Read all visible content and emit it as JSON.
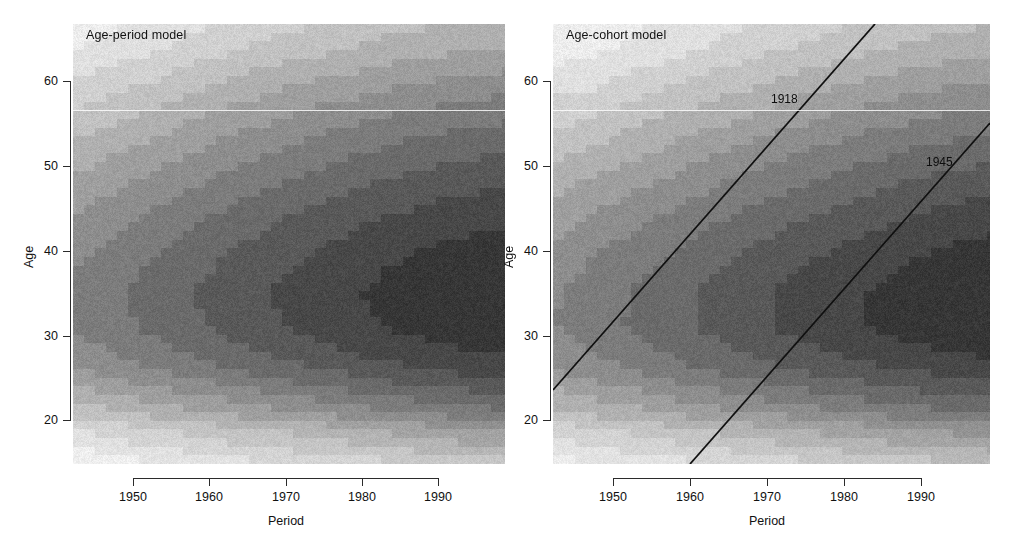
{
  "figure": {
    "width": 1013,
    "height": 550,
    "background": "#ffffff"
  },
  "panels": [
    {
      "id": "age-period",
      "title": "Age-period model",
      "x_axis": {
        "label": "Period",
        "ticks": [
          1950,
          1960,
          1970,
          1980,
          1990
        ],
        "range": [
          1943,
          1998
        ]
      },
      "y_axis": {
        "label": "Age",
        "ticks": [
          20,
          30,
          40,
          50,
          60
        ],
        "range": [
          14,
          65
        ]
      },
      "cohort_lines": []
    },
    {
      "id": "age-cohort",
      "title": "Age-cohort model",
      "x_axis": {
        "label": "Period",
        "ticks": [
          1950,
          1960,
          1970,
          1980,
          1990
        ],
        "range": [
          1943,
          1998
        ]
      },
      "y_axis": {
        "label": "Age",
        "ticks": [
          20,
          30,
          40,
          50,
          60
        ],
        "range": [
          14,
          65
        ]
      },
      "cohort_lines": [
        {
          "label": "1918",
          "cohort": 1918,
          "label_period": 1973.5,
          "label_age": 57.0
        },
        {
          "label": "1945",
          "cohort": 1945,
          "label_period": 1993.5,
          "label_age": 50.0
        }
      ]
    }
  ],
  "chart_data": {
    "type": "heatmap",
    "xlabel": "Period",
    "ylabel": "Age",
    "xlim": [
      1943,
      1998
    ],
    "ylim": [
      14,
      65
    ],
    "grid": false,
    "legend": "none",
    "colormap": "grayscale",
    "level_colors": [
      "#f2f2f2",
      "#e4e4e4",
      "#d4d4d4",
      "#c4c4c4",
      "#b2b2b2",
      "#a0a0a0",
      "#8e8e8e",
      "#7c7c7c",
      "#6a6a6a",
      "#585858",
      "#464646",
      "#343434"
    ],
    "n_levels": 12,
    "note": "Darker shading indicates higher modelled rate. Rate surface peaks near period 1988-1998, age 28-36.",
    "peak": {
      "period": 1992,
      "age": 32
    },
    "panels": [
      {
        "id": "age-period",
        "model": "Age-period model",
        "description": "Contour surface that is a product of a smooth age effect (peaking near age 32) and a monotonically increasing period effect; contour bands run diagonally up to the right in the upper half and horizontally across the lower band.",
        "x": [
          1943,
          1948,
          1953,
          1958,
          1963,
          1968,
          1973,
          1978,
          1983,
          1988,
          1993,
          1998
        ],
        "y": [
          14,
          18,
          22,
          26,
          30,
          34,
          38,
          42,
          46,
          50,
          54,
          58,
          62,
          65
        ],
        "values": [
          [
            0.5,
            0.6,
            0.7,
            0.8,
            0.9,
            1.0,
            1.1,
            1.2,
            1.3,
            1.5,
            1.6,
            1.7
          ],
          [
            1.0,
            1.2,
            1.4,
            1.6,
            1.8,
            2.0,
            2.2,
            2.5,
            2.8,
            3.1,
            3.4,
            3.6
          ],
          [
            2.2,
            2.6,
            3.0,
            3.4,
            3.9,
            4.4,
            5.0,
            5.6,
            6.2,
            6.8,
            7.4,
            7.9
          ],
          [
            3.8,
            4.4,
            5.1,
            5.9,
            6.8,
            7.7,
            8.6,
            9.6,
            10.6,
            11.5,
            12.3,
            12.9
          ],
          [
            4.8,
            5.6,
            6.5,
            7.6,
            8.8,
            10.0,
            11.2,
            12.5,
            13.8,
            15.0,
            16.0,
            16.8
          ],
          [
            4.9,
            5.8,
            6.8,
            7.9,
            9.1,
            10.4,
            11.7,
            13.1,
            14.4,
            15.6,
            16.7,
            17.5
          ],
          [
            4.4,
            5.2,
            6.1,
            7.1,
            8.2,
            9.3,
            10.5,
            11.8,
            13.0,
            14.1,
            15.1,
            15.8
          ],
          [
            3.7,
            4.3,
            5.0,
            5.9,
            6.8,
            7.8,
            8.8,
            9.8,
            10.8,
            11.7,
            12.5,
            13.1
          ],
          [
            2.9,
            3.4,
            4.0,
            4.6,
            5.4,
            6.1,
            6.9,
            7.7,
            8.5,
            9.2,
            9.9,
            10.4
          ],
          [
            2.2,
            2.6,
            3.0,
            3.5,
            4.1,
            4.7,
            5.3,
            5.9,
            6.5,
            7.1,
            7.6,
            8.0
          ],
          [
            1.6,
            1.9,
            2.2,
            2.6,
            3.0,
            3.4,
            3.9,
            4.3,
            4.8,
            5.2,
            5.6,
            5.9
          ],
          [
            1.1,
            1.3,
            1.5,
            1.8,
            2.1,
            2.4,
            2.7,
            3.0,
            3.3,
            3.6,
            3.9,
            4.1
          ],
          [
            0.7,
            0.9,
            1.0,
            1.2,
            1.4,
            1.6,
            1.8,
            2.0,
            2.2,
            2.4,
            2.6,
            2.7
          ],
          [
            0.6,
            0.7,
            0.8,
            1.0,
            1.1,
            1.3,
            1.4,
            1.6,
            1.8,
            1.9,
            2.1,
            2.2
          ]
        ]
      },
      {
        "id": "age-cohort",
        "model": "Age-cohort model",
        "description": "Contour surface that is a product of a smooth age effect (peaking near age 32) and a cohort effect increasing with year of birth; contour bands are tilted along cohort diagonals. Reference cohort lines for 1918 and 1945 are drawn.",
        "x": [
          1943,
          1948,
          1953,
          1958,
          1963,
          1968,
          1973,
          1978,
          1983,
          1988,
          1993,
          1998
        ],
        "y": [
          14,
          18,
          22,
          26,
          30,
          34,
          38,
          42,
          46,
          50,
          54,
          58,
          62,
          65
        ],
        "values": [
          [
            0.6,
            0.7,
            0.8,
            0.9,
            1.0,
            1.1,
            1.3,
            1.4,
            1.5,
            1.7,
            1.8,
            1.9
          ],
          [
            1.2,
            1.4,
            1.6,
            1.8,
            2.1,
            2.3,
            2.6,
            2.9,
            3.2,
            3.5,
            3.8,
            4.0
          ],
          [
            2.4,
            2.8,
            3.2,
            3.7,
            4.2,
            4.8,
            5.4,
            6.0,
            6.6,
            7.3,
            7.9,
            8.4
          ],
          [
            3.9,
            4.5,
            5.2,
            6.0,
            6.9,
            7.8,
            8.8,
            9.8,
            10.8,
            11.8,
            12.6,
            13.3
          ],
          [
            4.6,
            5.4,
            6.3,
            7.3,
            8.5,
            9.7,
            11.0,
            12.3,
            13.6,
            14.9,
            16.0,
            16.9
          ],
          [
            4.5,
            5.3,
            6.2,
            7.3,
            8.4,
            9.7,
            11.0,
            12.4,
            13.7,
            15.0,
            16.2,
            17.2
          ],
          [
            3.9,
            4.6,
            5.4,
            6.3,
            7.3,
            8.4,
            9.6,
            10.8,
            12.0,
            13.2,
            14.3,
            15.2
          ],
          [
            3.2,
            3.7,
            4.4,
            5.1,
            5.9,
            6.8,
            7.8,
            8.8,
            9.8,
            10.8,
            11.7,
            12.5
          ],
          [
            2.5,
            2.9,
            3.4,
            3.9,
            4.6,
            5.3,
            6.0,
            6.8,
            7.6,
            8.4,
            9.1,
            9.7
          ],
          [
            1.8,
            2.1,
            2.5,
            2.9,
            3.4,
            3.9,
            4.5,
            5.1,
            5.7,
            6.3,
            6.8,
            7.3
          ],
          [
            1.3,
            1.5,
            1.8,
            2.1,
            2.4,
            2.8,
            3.2,
            3.7,
            4.1,
            4.5,
            4.9,
            5.3
          ],
          [
            0.9,
            1.0,
            1.2,
            1.4,
            1.7,
            1.9,
            2.2,
            2.5,
            2.8,
            3.1,
            3.4,
            3.6
          ],
          [
            0.6,
            0.7,
            0.8,
            0.9,
            1.1,
            1.3,
            1.5,
            1.7,
            1.9,
            2.1,
            2.3,
            2.4
          ],
          [
            0.5,
            0.6,
            0.7,
            0.8,
            0.9,
            1.1,
            1.2,
            1.4,
            1.5,
            1.7,
            1.8,
            2.0
          ]
        ]
      }
    ]
  }
}
